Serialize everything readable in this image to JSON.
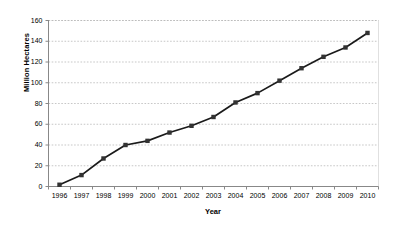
{
  "chart_data": {
    "type": "line",
    "title": "",
    "xlabel": "Year",
    "ylabel": "Million Hectares",
    "categories": [
      "1996",
      "1997",
      "1998",
      "1999",
      "2000",
      "2001",
      "2002",
      "2003",
      "2004",
      "2005",
      "2006",
      "2007",
      "2008",
      "2009",
      "2010"
    ],
    "x": [
      1996,
      1997,
      1998,
      1999,
      2000,
      2001,
      2002,
      2003,
      2004,
      2005,
      2006,
      2007,
      2008,
      2009,
      2010
    ],
    "values": [
      1.7,
      11,
      27,
      40,
      44,
      52,
      58.5,
      67,
      81,
      90,
      102,
      114,
      125,
      134,
      148
    ],
    "series": [
      {
        "name": "Million Hectares",
        "values": [
          1.7,
          11,
          27,
          40,
          44,
          52,
          58.5,
          67,
          81,
          90,
          102,
          114,
          125,
          134,
          148
        ]
      }
    ],
    "ylim": [
      0,
      160
    ],
    "yticks": [
      0,
      20,
      40,
      60,
      80,
      100,
      120,
      140,
      160
    ],
    "ytick_labels": [
      "0",
      "20",
      "40",
      "60",
      "80",
      "100",
      "120",
      "140",
      "160"
    ],
    "xtick_labels": [
      "1996",
      "1997",
      "1998",
      "1999",
      "2000",
      "2001",
      "2002",
      "2003",
      "2004",
      "2005",
      "2006",
      "2007",
      "2008",
      "2009",
      "2010"
    ],
    "grid": "horizontal-dotted",
    "legend": "none",
    "marker": "square",
    "line_color": "#1a1a1a",
    "marker_color": "#333333",
    "grid_color": "#b9b9b9",
    "axis_color": "#888888",
    "background": "#ffffff"
  }
}
